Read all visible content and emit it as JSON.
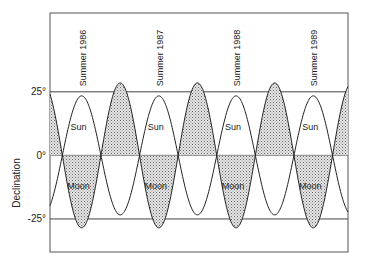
{
  "chart_data": {
    "type": "line",
    "title": "",
    "xlabel": "",
    "ylabel": "Declination",
    "ylim": [
      -38,
      56
    ],
    "y_ticks": [
      {
        "value": 25,
        "label": "25°"
      },
      {
        "value": 0,
        "label": "0°"
      },
      {
        "value": -25,
        "label": "-25°"
      }
    ],
    "x_unit": "years",
    "xlim": [
      1985.59,
      1989.45
    ],
    "grid": "horizontal lines at 25°, 0°, -25°",
    "legend": "none (inline labels)",
    "annotations": [
      {
        "text": "Summer 1986",
        "x": 1986.0
      },
      {
        "text": "Summer 1987",
        "x": 1987.0
      },
      {
        "text": "Summer 1988",
        "x": 1988.0
      },
      {
        "text": "Summer 1989",
        "x": 1989.0
      }
    ],
    "inline_labels": [
      {
        "series": "Sun",
        "text": "Sun",
        "x": [
          1985.96,
          1986.96,
          1987.96,
          1988.96
        ],
        "y": 11
      },
      {
        "series": "Moon",
        "text": "Moon",
        "x": [
          1985.96,
          1986.96,
          1987.96,
          1988.96
        ],
        "y": -12
      }
    ],
    "estimated": true,
    "estimation_note": "Values are not printed on the chart; they are read off the axes and gridlines and are approximate.",
    "series": [
      {
        "name": "Sun",
        "style": "line",
        "amplitude_deg": 23.4,
        "period_years": 1.0,
        "peak_at_year": 1986.0,
        "points": [
          [
            1985.59,
            -19.0
          ],
          [
            1986.0,
            23.4
          ],
          [
            1986.5,
            -23.4
          ],
          [
            1987.0,
            23.4
          ],
          [
            1987.5,
            -23.4
          ],
          [
            1988.0,
            23.4
          ],
          [
            1988.5,
            -23.4
          ],
          [
            1989.0,
            23.4
          ],
          [
            1989.45,
            -18.0
          ]
        ]
      },
      {
        "name": "Moon",
        "style": "shaded",
        "amplitude_deg": 28.5,
        "period_years": 1.0,
        "peak_at_year": 1986.5,
        "points": [
          [
            1985.59,
            23.1
          ],
          [
            1986.0,
            -28.5
          ],
          [
            1986.5,
            28.5
          ],
          [
            1987.0,
            -28.5
          ],
          [
            1987.5,
            28.5
          ],
          [
            1988.0,
            -28.5
          ],
          [
            1988.5,
            28.5
          ],
          [
            1989.0,
            -28.5
          ],
          [
            1989.45,
            22.0
          ]
        ]
      }
    ]
  }
}
